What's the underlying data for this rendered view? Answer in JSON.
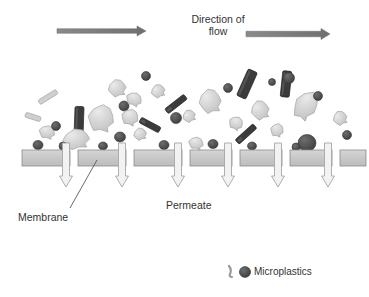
{
  "figure": {
    "type": "process-schematic",
    "background_color": "#ffffff"
  },
  "labels": {
    "flow_direction": "Direction of\nflow",
    "flow_direction_line1": "Direction of",
    "flow_direction_line2": "flow",
    "membrane": "Membrane",
    "permeate": "Permeate",
    "microplastics": "Microplastics"
  },
  "colors": {
    "flow_arrow": "#808080",
    "membrane_fill": "#c8c8c8",
    "membrane_stroke": "#8a8a8a",
    "permeate_arrow_fill": "#f2f2f2",
    "permeate_arrow_stroke": "#a6a6a6",
    "particle_dark": "#4d4d4d",
    "particle_mid": "#8c8c8c",
    "particle_light": "#d4d4d4",
    "text": "#333333",
    "leader_line": "#595959"
  },
  "flow_arrows": [
    {
      "name": "flow-arrow-left",
      "x1": 57,
      "y": 31,
      "x2": 146,
      "thickness": 4.5
    },
    {
      "name": "flow-arrow-right",
      "x1": 246,
      "y": 34,
      "x2": 330,
      "thickness": 5.5
    }
  ],
  "membrane": {
    "y": 150,
    "height": 16,
    "segments": [
      {
        "x": 22,
        "width": 48
      },
      {
        "x": 78,
        "width": 48
      },
      {
        "x": 134,
        "width": 48
      },
      {
        "x": 190,
        "width": 42
      },
      {
        "x": 240,
        "width": 42
      },
      {
        "x": 290,
        "width": 42
      },
      {
        "x": 340,
        "width": 26
      }
    ]
  },
  "permeate_arrows": [
    {
      "name": "permeate-arrow-1",
      "x": 66,
      "top": 143,
      "bottom": 187
    },
    {
      "name": "permeate-arrow-2",
      "x": 122,
      "top": 143,
      "bottom": 187
    },
    {
      "name": "permeate-arrow-3",
      "x": 178,
      "top": 143,
      "bottom": 187
    },
    {
      "name": "permeate-arrow-4",
      "x": 228,
      "top": 143,
      "bottom": 187
    },
    {
      "name": "permeate-arrow-5",
      "x": 278,
      "top": 143,
      "bottom": 187
    },
    {
      "name": "permeate-arrow-6",
      "x": 328,
      "top": 143,
      "bottom": 187
    }
  ],
  "leader_line": {
    "x1": 70,
    "y1": 208,
    "x2": 97,
    "y2": 160
  },
  "legend": {
    "fiber_glyph": {
      "x": 231,
      "y": 272
    },
    "particle_glyph": {
      "x": 245,
      "y": 272
    }
  },
  "particles": {
    "description": "Suspended microplastic particles above the membrane: dark rounded beads, dark elongated rods/fibres, and light-grey irregular flakes",
    "counts": {
      "dark_round": 30,
      "dark_rod": 12,
      "light_flake": 22
    },
    "items": [
      {
        "shape": "rod",
        "x": 48,
        "y": 97,
        "w": 21,
        "h": 5,
        "rot": -32,
        "tone": "light"
      },
      {
        "shape": "rod",
        "x": 79,
        "y": 122,
        "w": 9,
        "h": 31,
        "rot": 2,
        "tone": "dark"
      },
      {
        "shape": "flake",
        "x": 101,
        "y": 118,
        "w": 26,
        "h": 27,
        "rot": 10,
        "tone": "light"
      },
      {
        "shape": "flake",
        "x": 76,
        "y": 139,
        "w": 27,
        "h": 20,
        "rot": -8,
        "tone": "light"
      },
      {
        "shape": "flake",
        "x": 47,
        "y": 132,
        "w": 16,
        "h": 13,
        "rot": 14,
        "tone": "light"
      },
      {
        "shape": "round",
        "x": 38,
        "y": 145,
        "w": 10,
        "h": 9,
        "rot": 0,
        "tone": "dark"
      },
      {
        "shape": "round",
        "x": 63,
        "y": 146,
        "w": 8,
        "h": 8,
        "rot": 0,
        "tone": "dark"
      },
      {
        "shape": "round",
        "x": 56,
        "y": 126,
        "w": 9,
        "h": 9,
        "rot": 0,
        "tone": "dark"
      },
      {
        "shape": "flake",
        "x": 117,
        "y": 88,
        "w": 18,
        "h": 17,
        "rot": -12,
        "tone": "light"
      },
      {
        "shape": "round",
        "x": 124,
        "y": 106,
        "w": 10,
        "h": 10,
        "rot": 0,
        "tone": "dark"
      },
      {
        "shape": "flake",
        "x": 130,
        "y": 117,
        "w": 17,
        "h": 16,
        "rot": 20,
        "tone": "light"
      },
      {
        "shape": "round",
        "x": 120,
        "y": 137,
        "w": 11,
        "h": 10,
        "rot": 0,
        "tone": "dark"
      },
      {
        "shape": "round",
        "x": 103,
        "y": 146,
        "w": 9,
        "h": 8,
        "rot": 0,
        "tone": "dark"
      },
      {
        "shape": "flake",
        "x": 140,
        "y": 134,
        "w": 13,
        "h": 12,
        "rot": -15,
        "tone": "light"
      },
      {
        "shape": "round",
        "x": 146,
        "y": 76,
        "w": 9,
        "h": 9,
        "rot": 0,
        "tone": "dark"
      },
      {
        "shape": "flake",
        "x": 134,
        "y": 99,
        "w": 16,
        "h": 13,
        "rot": 25,
        "tone": "light"
      },
      {
        "shape": "rod",
        "x": 176,
        "y": 104,
        "w": 24,
        "h": 6,
        "rot": -38,
        "tone": "dark"
      },
      {
        "shape": "round",
        "x": 176,
        "y": 118,
        "w": 11,
        "h": 11,
        "rot": 0,
        "tone": "dark"
      },
      {
        "shape": "rod",
        "x": 150,
        "y": 125,
        "w": 22,
        "h": 6,
        "rot": 28,
        "tone": "dark"
      },
      {
        "shape": "flake",
        "x": 158,
        "y": 91,
        "w": 14,
        "h": 13,
        "rot": -20,
        "tone": "light"
      },
      {
        "shape": "round",
        "x": 164,
        "y": 145,
        "w": 10,
        "h": 9,
        "rot": 0,
        "tone": "dark"
      },
      {
        "shape": "flake",
        "x": 196,
        "y": 143,
        "w": 15,
        "h": 12,
        "rot": 12,
        "tone": "light"
      },
      {
        "shape": "round",
        "x": 213,
        "y": 144,
        "w": 10,
        "h": 9,
        "rot": 0,
        "tone": "dark"
      },
      {
        "shape": "flake",
        "x": 210,
        "y": 101,
        "w": 22,
        "h": 24,
        "rot": -10,
        "tone": "light"
      },
      {
        "shape": "rod",
        "x": 247,
        "y": 84,
        "w": 10,
        "h": 29,
        "rot": 24,
        "tone": "dark"
      },
      {
        "shape": "flake",
        "x": 236,
        "y": 123,
        "w": 14,
        "h": 13,
        "rot": 30,
        "tone": "light"
      },
      {
        "shape": "round",
        "x": 228,
        "y": 88,
        "w": 9,
        "h": 9,
        "rot": 0,
        "tone": "dark"
      },
      {
        "shape": "flake",
        "x": 189,
        "y": 116,
        "w": 13,
        "h": 12,
        "rot": -25,
        "tone": "light"
      },
      {
        "shape": "rod",
        "x": 246,
        "y": 134,
        "w": 24,
        "h": 6,
        "rot": -42,
        "tone": "dark"
      },
      {
        "shape": "round",
        "x": 252,
        "y": 146,
        "w": 9,
        "h": 8,
        "rot": 0,
        "tone": "dark"
      },
      {
        "shape": "round",
        "x": 272,
        "y": 82,
        "w": 7,
        "h": 7,
        "rot": 0,
        "tone": "dark"
      },
      {
        "shape": "rod",
        "x": 286,
        "y": 84,
        "w": 9,
        "h": 26,
        "rot": 6,
        "tone": "dark"
      },
      {
        "shape": "round",
        "x": 289,
        "y": 78,
        "w": 11,
        "h": 11,
        "rot": 0,
        "tone": "dark"
      },
      {
        "shape": "flake",
        "x": 306,
        "y": 105,
        "w": 22,
        "h": 30,
        "rot": 32,
        "tone": "light"
      },
      {
        "shape": "round",
        "x": 318,
        "y": 96,
        "w": 9,
        "h": 9,
        "rot": 0,
        "tone": "dark"
      },
      {
        "shape": "flake",
        "x": 260,
        "y": 110,
        "w": 18,
        "h": 19,
        "rot": -18,
        "tone": "light"
      },
      {
        "shape": "flake",
        "x": 277,
        "y": 130,
        "w": 13,
        "h": 13,
        "rot": 15,
        "tone": "light"
      },
      {
        "shape": "round",
        "x": 307,
        "y": 143,
        "w": 18,
        "h": 17,
        "rot": 0,
        "tone": "dark"
      },
      {
        "shape": "round",
        "x": 296,
        "y": 147,
        "w": 8,
        "h": 8,
        "rot": 0,
        "tone": "dark"
      },
      {
        "shape": "flake",
        "x": 340,
        "y": 118,
        "w": 14,
        "h": 14,
        "rot": -22,
        "tone": "light"
      },
      {
        "shape": "round",
        "x": 347,
        "y": 135,
        "w": 9,
        "h": 9,
        "rot": 0,
        "tone": "dark"
      },
      {
        "shape": "rod",
        "x": 33,
        "y": 117,
        "w": 16,
        "h": 5,
        "rot": 18,
        "tone": "light"
      }
    ]
  }
}
